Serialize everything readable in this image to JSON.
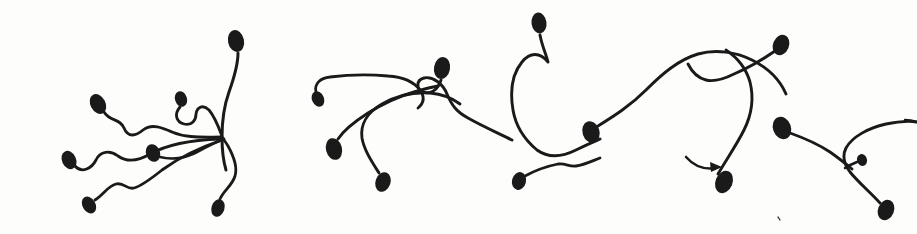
{
  "figure": {
    "title": "Hand-drawn ink illustration of spermatozoa",
    "subject": "spermatozoa",
    "style": "hand-drawn ink line drawing",
    "medium": "pen and ink on white paper",
    "width": 917,
    "height": 234,
    "background_color": "#fdfdfc",
    "ink_color": "#1a1a1a",
    "cell_count": 17,
    "annotation_count": 1,
    "visible_text": ""
  },
  "cells": [
    {
      "id": "cell-01",
      "label": "sperm-far-left-upper",
      "head": {
        "cx": 98,
        "cy": 104,
        "rx": 7.5,
        "ry": 10.5,
        "rotation": -28
      },
      "tail": "M 104 112 C 110 122, 120 118, 124 128 C 128 138, 136 136, 143 130 C 152 123, 163 128, 172 132 C 186 138, 200 137, 221 137",
      "tail_width": 2.8
    },
    {
      "id": "cell-02",
      "label": "sperm-far-left-lower",
      "head": {
        "cx": 69,
        "cy": 160,
        "rx": 7,
        "ry": 9.5,
        "rotation": -25
      },
      "tail": "M 75 166 C 82 174, 92 168, 96 160 C 100 151, 110 150, 118 156 C 128 163, 140 160, 150 154 C 168 144, 192 140, 220 139",
      "tail_width": 2.8
    },
    {
      "id": "cell-03",
      "label": "sperm-left-small-curl",
      "head": {
        "cx": 181,
        "cy": 99,
        "rx": 6,
        "ry": 8,
        "rotation": -18
      },
      "tail": "M 180 107 C 174 114, 176 122, 184 124 C 192 126, 196 120, 196 114 C 197 107, 203 104, 209 110 C 215 117, 219 128, 222 136",
      "tail_width": 2.8
    },
    {
      "id": "cell-04",
      "label": "sperm-left-mid-node",
      "head": {
        "cx": 153,
        "cy": 153,
        "rx": 7,
        "ry": 9,
        "rotation": -20
      },
      "tail": "M 160 157 C 172 160, 186 158, 197 152 C 208 146, 216 142, 224 139",
      "tail_width": 2.8
    },
    {
      "id": "cell-05",
      "label": "sperm-bottom-left",
      "head": {
        "cx": 89,
        "cy": 205,
        "rx": 6.5,
        "ry": 9,
        "rotation": -30
      },
      "tail": "M 95 200 C 104 194, 108 186, 116 184 C 124 182, 127 190, 134 188 C 142 186, 152 178, 162 170 C 180 157, 204 146, 222 140",
      "tail_width": 2.8
    },
    {
      "id": "cell-06",
      "label": "sperm-upper-left-long",
      "head": {
        "cx": 236,
        "cy": 41,
        "rx": 8,
        "ry": 11,
        "rotation": -12
      },
      "tail": "M 238 53 C 238 66, 234 78, 229 92 C 224 106, 222 122, 222 137 C 222 148, 223 160, 226 170",
      "tail_width": 3.0
    },
    {
      "id": "cell-07",
      "label": "sperm-center-descending",
      "head": {
        "cx": 218,
        "cy": 208,
        "rx": 6.5,
        "ry": 9,
        "rotation": 18
      },
      "tail": "M 220 199 C 224 190, 232 186, 235 176 C 238 166, 233 155, 228 146 C 225 141, 223 139, 222 137",
      "tail_width": 2.8
    },
    {
      "id": "cell-08",
      "label": "sperm-center-upper-arc",
      "head": {
        "cx": 318,
        "cy": 99,
        "rx": 6,
        "ry": 8,
        "rotation": -25
      },
      "tail": "M 316 92 C 314 84, 320 78, 330 77 C 346 75, 366 74, 388 76 C 404 77, 414 82, 420 90 C 425 97, 424 103, 418 108",
      "tail_width": 2.8
    },
    {
      "id": "cell-09",
      "label": "sperm-center-head-right",
      "head": {
        "cx": 442,
        "cy": 68,
        "rx": 8,
        "ry": 11,
        "rotation": 10
      },
      "tail": "M 441 80 C 438 90, 430 95, 423 92 C 416 89, 416 80, 424 78 C 433 76, 443 84, 447 94 C 452 106, 457 112, 468 118 C 482 126, 498 133, 512 140",
      "tail_width": 2.9
    },
    {
      "id": "cell-10",
      "label": "sperm-center-lower-left",
      "head": {
        "cx": 334,
        "cy": 149,
        "rx": 8,
        "ry": 11,
        "rotation": -14
      },
      "tail": "M 338 139 C 344 130, 354 122, 368 113 C 384 103, 400 96, 414 92 C 424 89, 432 87, 438 86",
      "tail_width": 2.9
    },
    {
      "id": "cell-11",
      "label": "sperm-center-lower-hook",
      "head": {
        "cx": 383,
        "cy": 182,
        "rx": 7.5,
        "ry": 10,
        "rotation": 20
      },
      "tail": "M 379 173 C 372 162, 364 150, 362 138 C 360 124, 368 112, 382 104 C 398 95, 414 92, 430 93 C 442 94, 452 98, 460 104",
      "tail_width": 2.9
    },
    {
      "id": "cell-12",
      "label": "sperm-top-center-big-loop",
      "head": {
        "cx": 539,
        "cy": 23,
        "rx": 7.5,
        "ry": 10.5,
        "rotation": -8
      },
      "tail": "M 540 35 C 542 46, 546 54, 548 62 C 540 52, 530 52, 522 62 C 512 74, 510 92, 513 110 C 516 128, 525 140, 537 150 C 548 158, 562 157, 576 150 C 590 143, 598 140, 600 139",
      "tail_width": 2.9
    },
    {
      "id": "cell-13",
      "label": "sperm-center-right-long-tail",
      "head": {
        "cx": 591,
        "cy": 132,
        "rx": 8.5,
        "ry": 11,
        "rotation": -18
      },
      "tail": "M 598 126 C 614 116, 630 106, 646 90 C 662 74, 678 60, 698 54 C 716 49, 736 52, 752 60 C 768 68, 780 80, 786 94",
      "tail_width": 2.9
    },
    {
      "id": "cell-14",
      "label": "sperm-small-lower-center",
      "head": {
        "cx": 519,
        "cy": 181,
        "rx": 7,
        "ry": 9,
        "rotation": 14
      },
      "tail": "M 525 176 C 536 170, 548 166, 558 164 C 566 163, 569 167, 576 166 C 584 165, 592 161, 600 158",
      "tail_width": 2.8
    },
    {
      "id": "cell-15",
      "label": "sperm-right-upper-diagonal",
      "head": {
        "cx": 781,
        "cy": 45,
        "rx": 8,
        "ry": 10.5,
        "rotation": 22
      },
      "tail": "M 775 51 C 762 60, 748 68, 734 74 C 722 80, 714 82, 706 80 C 698 78, 692 72, 688 64",
      "tail_width": 2.9
    },
    {
      "id": "cell-16",
      "label": "sperm-right-descending-long",
      "head": {
        "cx": 724,
        "cy": 182,
        "rx": 8.5,
        "ry": 11.5,
        "rotation": 22
      },
      "tail": "M 718 174 C 726 160, 736 146, 744 130 C 752 114, 754 98, 750 82 C 746 68, 738 58, 726 50",
      "tail_width": 2.9
    },
    {
      "id": "cell-17",
      "label": "sperm-far-right-upper",
      "head": {
        "cx": 782,
        "cy": 128,
        "rx": 9,
        "ry": 11.5,
        "rotation": -20
      },
      "tail": "M 790 133 C 804 138, 818 144, 830 152 C 840 159, 846 164, 852 169",
      "tail_width": 2.9
    },
    {
      "id": "cell-18",
      "label": "sperm-far-right-lower",
      "head": {
        "cx": 886,
        "cy": 210,
        "rx": 8,
        "ry": 10.5,
        "rotation": 22
      },
      "tail": "M 880 203 C 870 192, 858 182, 850 172 C 844 164, 842 156, 846 148 C 852 137, 868 128, 886 124 C 900 121, 910 121, 917 122",
      "tail_width": 2.9
    },
    {
      "id": "cell-19",
      "label": "sperm-far-right-tiny",
      "head": {
        "cx": 862,
        "cy": 160,
        "rx": 5,
        "ry": 6,
        "rotation": -15
      },
      "tail": "M 857 162 C 852 164, 848 166, 845 168",
      "tail_width": 2.6
    }
  ],
  "annotations": [
    {
      "id": "annotation-arrow-01",
      "name": "motility-direction-arrow",
      "shape": "curved arrow pointing right",
      "path": "M 686 157 C 694 166, 704 170, 716 168",
      "tip": {
        "x": 722,
        "y": 167
      },
      "head_points": "722,167 710,162 711,172"
    }
  ],
  "strays": [
    {
      "id": "stray-01",
      "name": "ink-stroke-right-edge",
      "path": "M 905 120 C 910 120, 914 121, 917 122",
      "width": 2.4
    },
    {
      "id": "stray-02",
      "name": "ink-speck-lower-center",
      "path": "M 778 217 L 780 220",
      "width": 1.2
    }
  ]
}
